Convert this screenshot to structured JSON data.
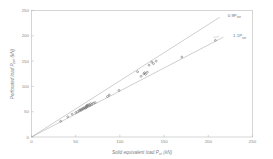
{
  "chart_data": {
    "type": "scatter",
    "title": "",
    "xlabel": "Solid equivalent load P_se (kN)",
    "xlabel_main": "Solid equivalent load P",
    "xlabel_sub": "se",
    "xlabel_unit": " (kN)",
    "ylabel": "Perforated load P_per (kN)",
    "ylabel_main": "Perforated load P",
    "ylabel_sub": "per",
    "ylabel_unit": " (kN)",
    "xlim": [
      0,
      250
    ],
    "ylim": [
      0,
      250
    ],
    "xticks": [
      0,
      50,
      100,
      150,
      200,
      250
    ],
    "yticks": [
      0,
      50,
      100,
      150,
      200,
      250
    ],
    "grid": false,
    "legend_position": "none",
    "annotations": [
      {
        "name": "upper-reference-line-label",
        "text": "0.9P_ser",
        "main": "0.9P",
        "sub": "ser",
        "x": 222,
        "y": 237
      },
      {
        "name": "lower-reference-line-label",
        "text": "1.1P_ser",
        "main": "1.1P",
        "sub": "ser",
        "x": 228,
        "y": 197
      }
    ],
    "reference_lines": [
      {
        "name": "upper-bound-line",
        "label": "0.9P_ser",
        "slope": 1.111,
        "intercept": 0,
        "x_start": 0,
        "y_start": 0,
        "x_end": 213,
        "y_end": 236.7
      },
      {
        "name": "lower-bound-line",
        "label": "1.1P_ser",
        "slope": 0.909,
        "intercept": 0,
        "x_start": 0,
        "y_start": 0,
        "x_end": 217,
        "y_end": 197.3
      }
    ],
    "series": [
      {
        "name": "test-data",
        "marker": "circle",
        "points": [
          [
            33,
            31
          ],
          [
            41,
            40
          ],
          [
            46,
            45
          ],
          [
            50,
            48
          ],
          [
            52,
            50
          ],
          [
            54,
            52
          ],
          [
            55,
            54
          ],
          [
            56,
            53
          ],
          [
            57,
            55
          ],
          [
            58,
            56
          ],
          [
            59,
            57
          ],
          [
            60,
            58
          ],
          [
            61,
            57
          ],
          [
            62,
            59
          ],
          [
            62,
            61
          ],
          [
            63,
            60
          ],
          [
            63,
            63
          ],
          [
            64,
            62
          ],
          [
            65,
            64
          ],
          [
            66,
            62
          ],
          [
            67,
            66
          ],
          [
            68,
            64
          ],
          [
            70,
            67
          ],
          [
            72,
            68
          ],
          [
            86,
            80
          ],
          [
            88,
            83
          ],
          [
            99,
            92
          ],
          [
            120,
            129
          ],
          [
            124,
            120
          ],
          [
            127,
            125
          ],
          [
            128,
            127
          ],
          [
            129,
            124
          ],
          [
            131,
            128
          ],
          [
            133,
            142
          ],
          [
            136,
            148
          ],
          [
            138,
            145
          ],
          [
            141,
            150
          ],
          [
            170,
            158
          ],
          [
            208,
            191
          ]
        ]
      }
    ]
  },
  "axes": {
    "x_tick_labels": [
      "0",
      "50",
      "100",
      "150",
      "200",
      "250"
    ],
    "y_tick_labels": [
      "0",
      "50",
      "100",
      "150",
      "200",
      "250"
    ]
  }
}
